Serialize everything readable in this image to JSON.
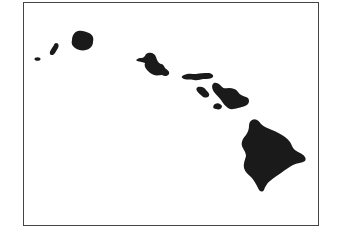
{
  "map": {
    "subject": "Hawaiian Islands",
    "colors": {
      "land": "#1a1a1a",
      "water": "#ffffff",
      "border": "#444444"
    },
    "islands": [
      {
        "name": "Kaula"
      },
      {
        "name": "Niihau"
      },
      {
        "name": "Kauai"
      },
      {
        "name": "Oahu"
      },
      {
        "name": "Molokai"
      },
      {
        "name": "Lanai"
      },
      {
        "name": "Maui"
      },
      {
        "name": "Kahoolawe"
      },
      {
        "name": "Hawaii"
      }
    ]
  }
}
